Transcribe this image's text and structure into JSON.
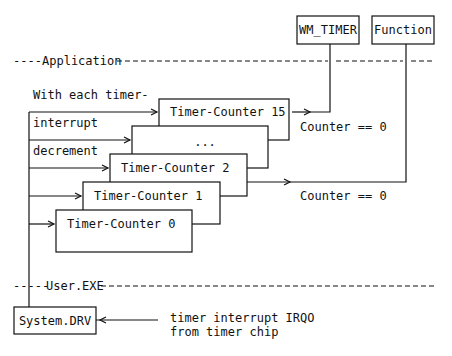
{
  "diagram": {
    "layers": {
      "application": "Application",
      "user_exe": "User.EXE"
    },
    "targets": {
      "wm_timer": "WM_TIMER",
      "function": "Function"
    },
    "side_label": {
      "line1": "With each timer-",
      "line2": "interrupt",
      "line3": "decrement"
    },
    "counters": [
      {
        "label": "Timer-Counter 15"
      },
      {
        "label": "..."
      },
      {
        "label": "Timer-Counter  2"
      },
      {
        "label": "Timer-Counter  1"
      },
      {
        "label": "Timer-Counter  0"
      }
    ],
    "conditions": {
      "upper": "Counter == 0",
      "lower": "Counter == 0"
    },
    "driver": "System.DRV",
    "interrupt_source": {
      "line1": "timer interrupt IRQO",
      "line2": "from timer chip"
    },
    "layer_prefix": "----",
    "layer_prefix_user": "-----"
  }
}
